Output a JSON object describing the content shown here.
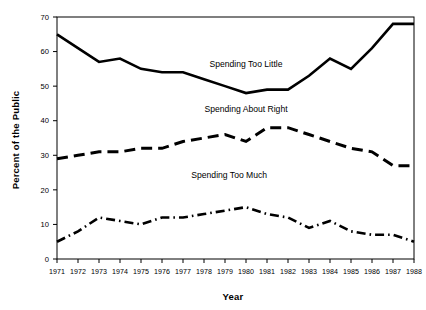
{
  "chart_data": {
    "type": "line",
    "title": "",
    "xlabel": "Year",
    "ylabel": "Percent of the Public",
    "categories": [
      "1971",
      "1972",
      "1973",
      "1974",
      "1975",
      "1976",
      "1977",
      "1978",
      "1979",
      "1980",
      "1981",
      "1982",
      "1983",
      "1984",
      "1985",
      "1986",
      "1987",
      "1988"
    ],
    "x": [
      1971,
      1972,
      1973,
      1974,
      1975,
      1976,
      1977,
      1978,
      1979,
      1980,
      1981,
      1982,
      1983,
      1984,
      1985,
      1986,
      1987,
      1988
    ],
    "xlim": [
      1971,
      1988
    ],
    "ylim": [
      0,
      70
    ],
    "yticks": [
      0,
      10,
      20,
      30,
      40,
      50,
      60,
      70
    ],
    "ytick_labels": [
      "0",
      "10",
      "20",
      "30",
      "40",
      "50",
      "60",
      "70"
    ],
    "grid": false,
    "legend_position": "inline-annotations",
    "series": [
      {
        "name": "Spending Too Little",
        "style": "solid",
        "color": "#000000",
        "values": [
          65,
          61,
          57,
          58,
          55,
          54,
          54,
          52,
          50,
          48,
          49,
          49,
          53,
          58,
          55,
          61,
          68,
          68
        ]
      },
      {
        "name": "Spending About Right",
        "style": "dashed",
        "color": "#000000",
        "values": [
          29,
          30,
          31,
          31,
          32,
          32,
          34,
          35,
          36,
          34,
          38,
          38,
          36,
          34,
          32,
          31,
          27,
          27
        ]
      },
      {
        "name": "Spending Too Much",
        "style": "dash-dot",
        "color": "#000000",
        "values": [
          5,
          8,
          12,
          11,
          10,
          12,
          12,
          13,
          14,
          15,
          13,
          12,
          9,
          11,
          8,
          7,
          7,
          5
        ]
      }
    ],
    "annotations": [
      {
        "text": "Spending Too Little",
        "x": 1980.0,
        "y": 55.5
      },
      {
        "text": "Spending About Right",
        "x": 1980.0,
        "y": 42.5
      },
      {
        "text": "Spending Too Much",
        "x": 1979.2,
        "y": 23.5
      }
    ]
  }
}
